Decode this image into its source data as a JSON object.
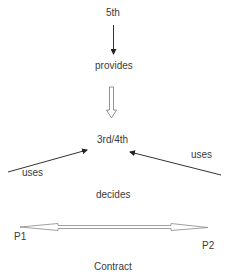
{
  "diagram": {
    "nodes": {
      "fifth": "5th",
      "provides": "provides",
      "third_fourth": "3rd/4th",
      "uses_left": "uses",
      "uses_right": "uses",
      "decides": "decides",
      "p1": "P1",
      "p2": "P2",
      "contract": "Contract"
    },
    "edges": [
      {
        "from": "5th",
        "to": "provides",
        "style": "solid-arrow"
      },
      {
        "from": "provides",
        "to": "3rd/4th",
        "style": "hollow-block-arrow"
      },
      {
        "from": "left",
        "to": "3rd/4th",
        "label": "uses",
        "style": "solid-arrow"
      },
      {
        "from": "right",
        "to": "3rd/4th",
        "label": "uses",
        "style": "solid-arrow"
      },
      {
        "from": "P1",
        "to": "P2",
        "style": "hollow-double-arrow"
      }
    ]
  }
}
